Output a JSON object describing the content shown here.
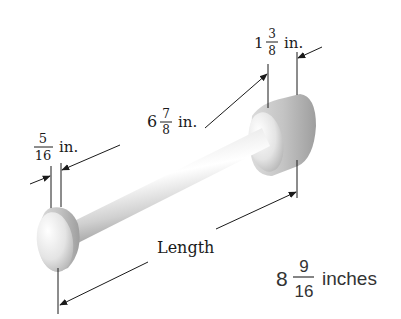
{
  "diagram": {
    "labels": {
      "end_thickness": {
        "whole": "",
        "numerator": "5",
        "denominator": "16",
        "unit": "in."
      },
      "shaft_length": {
        "whole": "6",
        "numerator": "7",
        "denominator": "8",
        "unit": "in."
      },
      "head_thickness": {
        "whole": "1",
        "numerator": "3",
        "denominator": "8",
        "unit": "in."
      },
      "length_label": "Length",
      "total": {
        "whole": "8",
        "numerator": "9",
        "denominator": "16",
        "unit": "inches"
      }
    },
    "colors": {
      "line": "#1a1a1a",
      "object_light": "#f4f4f4",
      "object_shade": "#b8b8b8",
      "answer_text": "#333333"
    }
  }
}
